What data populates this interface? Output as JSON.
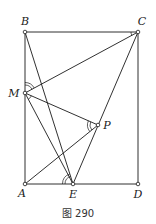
{
  "figure": {
    "caption": "图 290",
    "colors": {
      "line": "#1a1a1a",
      "background": "#ffffff"
    },
    "points": [
      {
        "id": "A",
        "label": "A"
      },
      {
        "id": "B",
        "label": "B"
      },
      {
        "id": "C",
        "label": "C"
      },
      {
        "id": "D",
        "label": "D"
      },
      {
        "id": "E",
        "label": "E"
      },
      {
        "id": "M",
        "label": "M"
      },
      {
        "id": "P",
        "label": "P"
      }
    ],
    "segments": [
      [
        "A",
        "B"
      ],
      [
        "B",
        "C"
      ],
      [
        "C",
        "D"
      ],
      [
        "D",
        "A"
      ],
      [
        "B",
        "E"
      ],
      [
        "M",
        "C"
      ],
      [
        "C",
        "E"
      ],
      [
        "M",
        "P"
      ],
      [
        "M",
        "E"
      ],
      [
        "A",
        "P"
      ]
    ],
    "angle_marks": [
      {
        "vertex": "M",
        "between": [
          "B",
          "C"
        ],
        "arcs": 2
      },
      {
        "vertex": "M",
        "between": [
          "P",
          "E"
        ],
        "arcs": 1
      },
      {
        "vertex": "C",
        "between": [
          "B",
          "M"
        ],
        "arcs": 1
      },
      {
        "vertex": "P",
        "between": [
          "M",
          "A"
        ],
        "arcs": 2
      },
      {
        "vertex": "E",
        "between": [
          "A",
          "B"
        ],
        "arcs": 2
      }
    ]
  }
}
